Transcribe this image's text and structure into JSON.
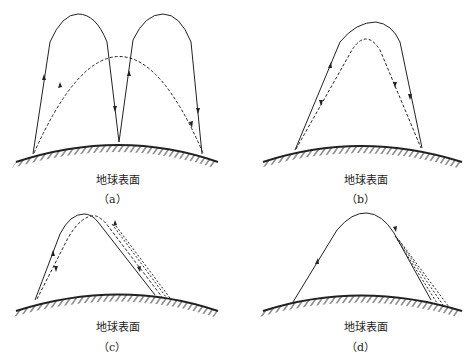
{
  "panels": [
    {
      "id": "a",
      "ground_label": "地球表面",
      "caption": "（a）"
    },
    {
      "id": "b",
      "ground_label": "地球表面",
      "caption": "（b）"
    },
    {
      "id": "c",
      "ground_label": "地球表面",
      "caption": "（c）"
    },
    {
      "id": "d",
      "ground_label": "地球表面",
      "caption": "（d）"
    }
  ],
  "figure_caption": "图",
  "colors": {
    "line": "#222222",
    "background": "#ffffff"
  }
}
